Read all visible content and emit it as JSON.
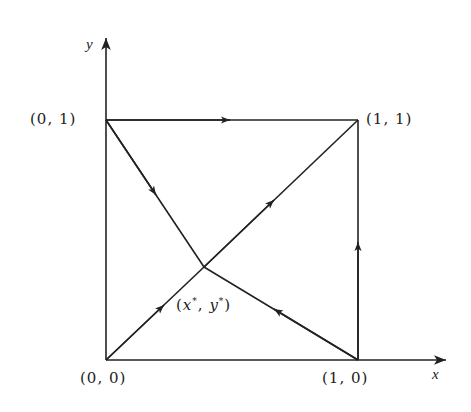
{
  "axes": {
    "x_label": "x",
    "y_label": "y"
  },
  "points": {
    "origin": "(0, 0)",
    "x_one": "(1, 0)",
    "y_one": "(0, 1)",
    "corner": "(1, 1)",
    "equilibrium": {
      "open": "(",
      "x": "x",
      "star1": "*",
      "sep": ", ",
      "y": "y",
      "star2": "*",
      "close": ")"
    }
  },
  "colors": {
    "line": "#222222",
    "background": "#ffffff"
  },
  "edges": [
    {
      "from": "(0,1)",
      "to": "(1,1)",
      "direction": "right"
    },
    {
      "from": "(0,1)",
      "to": "(x*,y*)",
      "direction": "down-right"
    },
    {
      "from": "(0,0)",
      "to": "(x*,y*)",
      "direction": "up-right"
    },
    {
      "from": "(x*,y*)",
      "to": "(1,1)",
      "direction": "up-right"
    },
    {
      "from": "(1,0)",
      "to": "(x*,y*)",
      "direction": "up-left"
    },
    {
      "from": "(1,0)",
      "to": "(1,1)",
      "direction": "up"
    }
  ]
}
